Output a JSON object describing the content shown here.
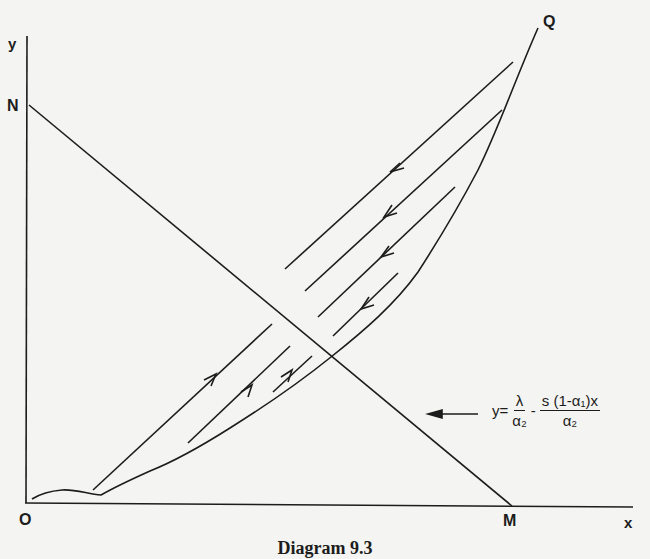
{
  "diagram": {
    "labels": {
      "y_axis": "y",
      "x_axis": "x",
      "origin": "O",
      "point_n": "N",
      "point_m": "M",
      "point_q": "Q"
    },
    "equation": {
      "lhs": "y=",
      "term1_num": "λ",
      "term1_den": "α₂",
      "operator": "-",
      "term2_num": "s (1-α₁)x",
      "term2_den": "α₂"
    },
    "caption": "Diagram 9.3",
    "colors": {
      "ink": "#1c1c1c",
      "paper": "#f4f4f2"
    }
  }
}
